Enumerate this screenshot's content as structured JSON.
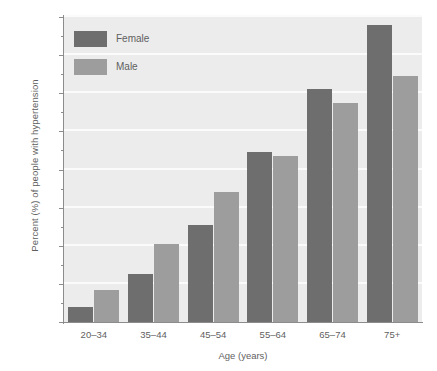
{
  "chart_data": {
    "type": "bar",
    "title": "",
    "xlabel": "Age (years)",
    "ylabel": "Percent (%) of people with hypertension",
    "categories": [
      "20–34",
      "35–44",
      "45–54",
      "55–64",
      "65–74",
      "75+"
    ],
    "series": [
      {
        "name": "Female",
        "color": "#6e6e6e",
        "values": [
          4,
          12.5,
          25.5,
          44.5,
          61,
          78
        ]
      },
      {
        "name": "Male",
        "color": "#9d9d9d",
        "values": [
          8.5,
          20.5,
          34,
          43.5,
          57.5,
          64.5
        ]
      }
    ],
    "ylim": [
      0,
      80
    ],
    "ytick_labels": [
      "0",
      "10",
      "20",
      "30",
      "40",
      "50",
      "60",
      "70",
      "80"
    ],
    "ytick_values": [
      0,
      10,
      20,
      30,
      40,
      50,
      60,
      70,
      80
    ],
    "yminor_step": 5,
    "grid": true,
    "grid_color": "#fbfbfb",
    "plot_background": "#ececec",
    "legend": {
      "position": "top-left",
      "entries": [
        {
          "label": "Female",
          "color": "#6e6e6e"
        },
        {
          "label": "Male",
          "color": "#9d9d9d"
        }
      ]
    }
  }
}
